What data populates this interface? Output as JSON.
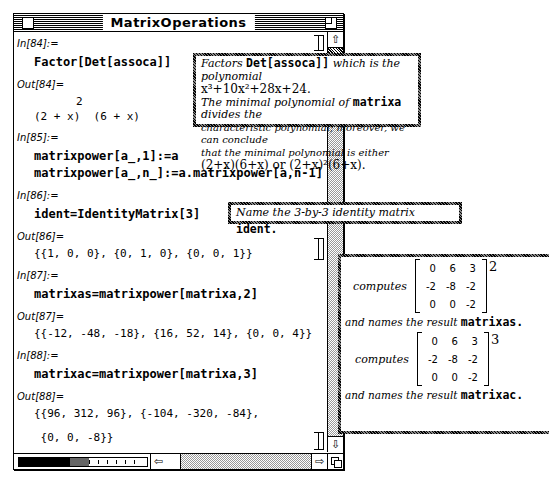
{
  "window": {
    "title": "MatrixOperations"
  },
  "cells": [
    {
      "in_label": "In[84]:=",
      "input": "Factor[Det[assoca]]",
      "out_label": "Out[84]=",
      "output_exp": "2",
      "output": "(2 + x)  (6 + x)"
    },
    {
      "in_label": "In[85]:=",
      "input_lines": [
        "matrixpower[a_,1]:=a",
        "matrixpower[a_,n_]:=a.matrixpower[a,n-1]"
      ]
    },
    {
      "in_label": "In[86]:=",
      "input": "ident=IdentityMatrix[3]",
      "out_label": "Out[86]=",
      "output": "{{1, 0, 0}, {0, 1, 0}, {0, 0, 1}}"
    },
    {
      "in_label": "In[87]:=",
      "input": "matrixas=matrixpower[matrixa,2]",
      "out_label": "Out[87]=",
      "output": "{{-12, -48, -18}, {16, 52, 14}, {0, 0, 4}}"
    },
    {
      "in_label": "In[88]:=",
      "input": "matrixac=matrixpower[matrixa,3]",
      "out_label": "Out[88]=",
      "output_lines": [
        "{{96, 312, 96}, {-104, -320, -84},",
        " {0, 0, -8}}"
      ]
    }
  ],
  "callouts": {
    "factor": {
      "t1": "Factors",
      "code1": "Det[assoca]]",
      "t2": "which is the polynomial",
      "poly": "x³+10x²+28x+24.",
      "t3": "The minimal polynomial of",
      "code2": "matrixa",
      "t4": "divides the",
      "t5": "characteristic polynomial; moreover, we can conclude",
      "t6": "that the minimal polynomial is either",
      "opt1": "(2+x)(6+x)",
      "or": "or",
      "opt2": "(2+x)²(6+x)."
    },
    "ident": {
      "t1": "Name the 3-by-3 identity matrix",
      "code": "ident."
    },
    "power": {
      "computes": "computes",
      "matrix": [
        [
          "0",
          "6",
          "3"
        ],
        [
          "-2",
          "-8",
          "-2"
        ],
        [
          "0",
          "0",
          "-2"
        ]
      ],
      "exp1": "2",
      "exp2": "3",
      "names": "and names the result",
      "res1": "matrixas.",
      "res2": "matrixac."
    }
  },
  "scroll": {
    "up": "⇧",
    "down": "⇩",
    "left": "⇦",
    "right": "⇨"
  }
}
